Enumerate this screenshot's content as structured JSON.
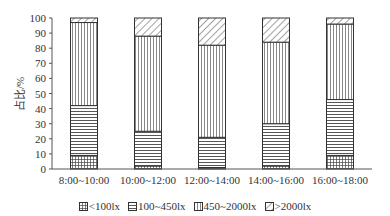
{
  "chart_data": {
    "type": "bar",
    "stacked": true,
    "title": "",
    "xlabel": "",
    "ylabel": "占比/%",
    "ylim": [
      0,
      100
    ],
    "yticks": [
      0,
      10,
      20,
      30,
      40,
      50,
      60,
      70,
      80,
      90,
      100
    ],
    "grid": false,
    "legend_position": "bottom",
    "categories": [
      "8:00~10:00",
      "10:00~12:00",
      "12:00~14:00",
      "14:00~16:00",
      "16:00~18:00"
    ],
    "series": [
      {
        "name": "<100lx",
        "pattern": "grid",
        "values": [
          9,
          2,
          1,
          2,
          9
        ]
      },
      {
        "name": "100~450lx",
        "pattern": "horizontal",
        "values": [
          33,
          23,
          20,
          28,
          37
        ]
      },
      {
        "name": "450~2000lx",
        "pattern": "vertical",
        "values": [
          55,
          63,
          61,
          54,
          50
        ]
      },
      {
        "name": ">2000lx",
        "pattern": "diagonal",
        "values": [
          3,
          12,
          18,
          16,
          4
        ]
      }
    ]
  },
  "axis": {
    "y_title": "占比/%"
  },
  "legend": [
    {
      "label": "<100lx",
      "pattern": "grid"
    },
    {
      "label": "100~450lx",
      "pattern": "horizontal"
    },
    {
      "label": "450~2000lx",
      "pattern": "vertical"
    },
    {
      "label": ">2000lx",
      "pattern": "diagonal"
    }
  ],
  "colors": {
    "stroke": "#333333",
    "axis": "#555555",
    "background": "#ffffff"
  }
}
